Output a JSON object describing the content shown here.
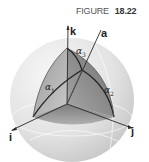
{
  "caption": {
    "word": "FIGURE",
    "number": "18.22"
  },
  "axes": {
    "k": "k",
    "a": "a",
    "i": "i",
    "j": "j"
  },
  "angles": {
    "alpha1": {
      "symbol": "α",
      "sub": "1"
    },
    "alpha2": {
      "symbol": "α",
      "sub": "2"
    },
    "alpha3": {
      "symbol": "α",
      "sub": "3"
    }
  },
  "colors": {
    "sphere_light": "#f2f2f2",
    "sphere_shade": "#bdbdbd",
    "octant_dark": "#8a8a8a",
    "line": "#2a2a2a"
  }
}
